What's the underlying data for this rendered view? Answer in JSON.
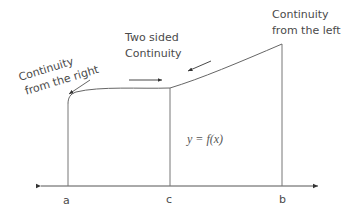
{
  "diagram": {
    "labels": {
      "right_continuity_line1": "Continuity",
      "right_continuity_line2": "from the right",
      "two_sided_line1": "Two sided",
      "two_sided_line2": "Continuity",
      "left_continuity_line1": "Continuity",
      "left_continuity_line2": "from the left",
      "function": "y = f(x)"
    },
    "axis": {
      "ticks": [
        "a",
        "c",
        "b"
      ]
    },
    "colors": {
      "line": "#555555",
      "text": "#4a4a4a"
    }
  }
}
